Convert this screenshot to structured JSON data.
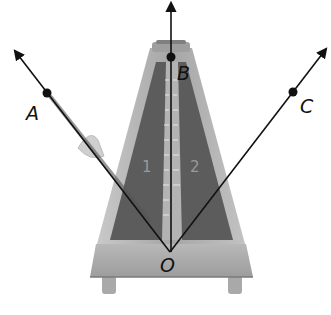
{
  "diagram": {
    "type": "geometry-angles",
    "vertex": {
      "label": "O",
      "x": 170,
      "y": 252
    },
    "rays": [
      {
        "name": "OA",
        "point_label": "A",
        "point": [
          47,
          93
        ],
        "arrow_end": [
          14,
          50
        ]
      },
      {
        "name": "OB",
        "point_label": "B",
        "point": [
          171,
          57
        ],
        "arrow_end": [
          171,
          2
        ]
      },
      {
        "name": "OC",
        "point_label": "C",
        "point": [
          293,
          92
        ],
        "arrow_end": [
          327,
          48
        ]
      }
    ],
    "angle_labels": [
      "1",
      "2"
    ],
    "colors": {
      "ray": "#111111",
      "point": "#111111",
      "metronome_body": "#a8a8a8",
      "metronome_dark": "#5a5a5a",
      "metronome_base": "#b5b5b5"
    }
  },
  "labels": {
    "A": "A",
    "B": "B",
    "C": "C",
    "O": "O",
    "angle1": "1",
    "angle2": "2"
  }
}
